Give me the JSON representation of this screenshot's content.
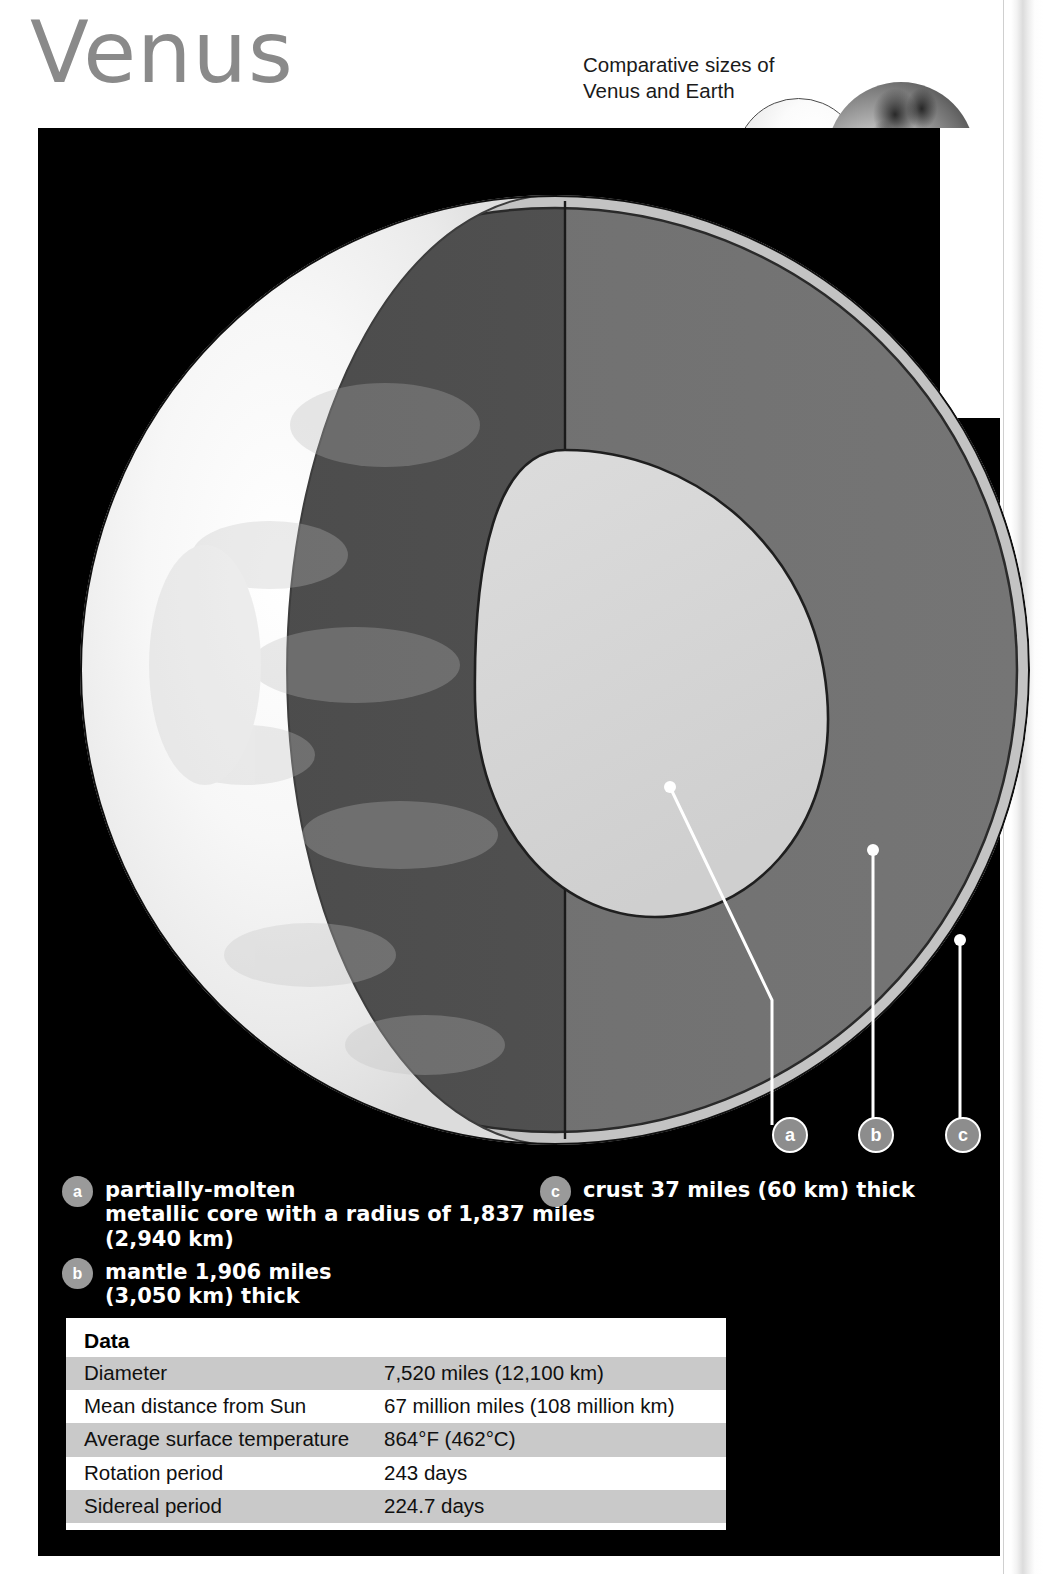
{
  "header": {
    "title": "Venus",
    "comparison_caption": "Comparative sizes of\nVenus and Earth",
    "globes": [
      {
        "name": "venus-globe",
        "label": "Venus"
      },
      {
        "name": "earth-globe",
        "label": "Earth"
      }
    ]
  },
  "callouts": [
    {
      "id": "a",
      "label": "a"
    },
    {
      "id": "b",
      "label": "b"
    },
    {
      "id": "c",
      "label": "c"
    }
  ],
  "legend": {
    "items": [
      {
        "badge": "a",
        "text": "partially-molten\nmetallic core with a radius of 1,837 miles\n(2,940 km)"
      },
      {
        "badge": "b",
        "text": "mantle 1,906 miles\n(3,050 km) thick"
      },
      {
        "badge": "c",
        "text": "crust 37 miles (60 km) thick"
      }
    ]
  },
  "data_table": {
    "header": "Data",
    "rows": [
      {
        "label": "Diameter",
        "value": "7,520 miles (12,100 km)"
      },
      {
        "label": "Mean distance from Sun",
        "value": "67 million miles (108 million km)"
      },
      {
        "label": "Average surface temperature",
        "value": "864°F (462°C)"
      },
      {
        "label": "Rotation period",
        "value": "243 days"
      },
      {
        "label": "Sidereal period",
        "value": "224.7 days"
      }
    ]
  },
  "colors": {
    "panel_background": "#000000",
    "title_gray": "#8a8a8a",
    "crust": "#c3c3c3",
    "mantle_left": "#4f4f4f",
    "mantle_right": "#6e6e6e",
    "core": "#d6d6d6",
    "surface": "#f4f4f4",
    "table_row_shaded": "#c9c9c9",
    "marker_fill": "#8d8d8d"
  },
  "diagram": {
    "layers": [
      {
        "name": "surface-clouds",
        "description": "Venus cloud-covered surface hemisphere"
      },
      {
        "name": "crust-shell",
        "description": "crust 37 miles (60 km) thick"
      },
      {
        "name": "mantle-shell",
        "description": "mantle 1,906 miles (3,050 km) thick"
      },
      {
        "name": "core-region",
        "description": "partially-molten metallic core, radius 1,837 miles (2,940 km)"
      }
    ]
  }
}
